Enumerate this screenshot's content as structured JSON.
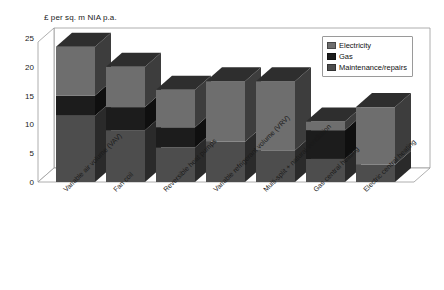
{
  "chart_data": {
    "type": "bar",
    "subtype": "stacked-3d-column",
    "title": "",
    "ylabel": "£ per sq. m NIA p.a.",
    "xlabel": "",
    "ylim": [
      0,
      25
    ],
    "ytick_labels": [
      "0",
      "5",
      "10",
      "15",
      "20",
      "25"
    ],
    "ytick_values": [
      0,
      5,
      10,
      15,
      20,
      25
    ],
    "grid": false,
    "legend_position": "top-right",
    "categories": [
      "Variable air volume (VAV)",
      "Fan coil",
      "Reversible heat pumps",
      "Variable refrigerant volume (VRV)",
      "Multi-split + natural ventilation",
      "Gas central heating",
      "Electric central heating"
    ],
    "series": [
      {
        "name": "Maintenance/repairs",
        "color": "#4d4d4d",
        "values": [
          11.5,
          9.0,
          6.0,
          7.0,
          5.5,
          4.0,
          3.0
        ]
      },
      {
        "name": "Gas",
        "color": "#1c1c1c",
        "values": [
          3.5,
          4.0,
          3.5,
          0.0,
          0.0,
          5.0,
          0.0
        ]
      },
      {
        "name": "Electricity",
        "color": "#6e6e6e",
        "values": [
          8.5,
          7.0,
          6.5,
          10.5,
          12.0,
          1.5,
          10.0
        ]
      }
    ],
    "totals": [
      23.5,
      20.0,
      16.0,
      17.5,
      17.5,
      10.5,
      13.0
    ]
  },
  "legend": {
    "items": [
      {
        "label": "Electricity",
        "color": "#6e6e6e"
      },
      {
        "label": "Gas",
        "color": "#1c1c1c"
      },
      {
        "label": "Maintenance/repairs",
        "color": "#4d4d4d"
      }
    ]
  },
  "colors": {
    "electricity": "#6e6e6e",
    "gas": "#1c1c1c",
    "maintenance": "#4d4d4d",
    "frame": "#9a9a9a",
    "text": "#1a1a1a",
    "background": "#ffffff"
  }
}
